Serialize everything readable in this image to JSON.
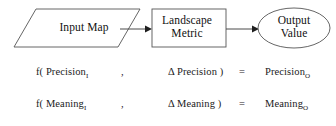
{
  "diagram": {
    "nodes": {
      "input": {
        "label": "Input Map",
        "shape": "parallelogram"
      },
      "process": {
        "label": "Landscape\nMetric",
        "shape": "rectangle"
      },
      "output": {
        "label": "Output\nValue",
        "shape": "ellipse"
      }
    },
    "connectors": [
      {
        "from": "input",
        "to": "process",
        "style": "arrow"
      },
      {
        "from": "process",
        "to": "output",
        "style": "arrow"
      }
    ],
    "colors": {
      "stroke": "#4d4d4d",
      "text": "#111111",
      "background": "#ffffff"
    }
  },
  "equations": [
    {
      "id": "precision",
      "function_open": "f( Precision",
      "function_open_sub": "I",
      "separator": ",",
      "delta_arg": "Δ Precision )",
      "equals": "=",
      "result": "Precision",
      "result_sub": "O"
    },
    {
      "id": "meaning",
      "function_open": "f( Meaning",
      "function_open_sub": "I",
      "separator": ",",
      "delta_arg": "Δ Meaning )",
      "equals": "=",
      "result": "Meaning",
      "result_sub": "O"
    }
  ]
}
